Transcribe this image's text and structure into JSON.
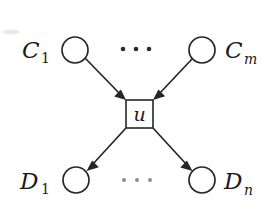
{
  "figure": {
    "background_color": "#ffffff",
    "ink_color": "#262626",
    "width": 278,
    "height": 212
  },
  "nodes": {
    "parents": [
      {
        "id": "C1",
        "label_base": "C",
        "label_sub": "1",
        "sub_style": "upright",
        "label_text": "C₁",
        "shape": "circle",
        "cx": 75,
        "cy": 50,
        "r": 13,
        "label_x": 22,
        "label_y": 58,
        "sub_x": 41,
        "sub_y": 63
      },
      {
        "id": "Cm",
        "label_base": "C",
        "label_sub": "m",
        "sub_style": "italic",
        "label_text": "Cₘ",
        "shape": "circle",
        "cx": 202,
        "cy": 50,
        "r": 13,
        "label_x": 225,
        "label_y": 58,
        "sub_x": 244,
        "sub_y": 64
      }
    ],
    "unit": {
      "id": "u",
      "label_text": "u",
      "shape": "square",
      "x": 126,
      "y": 100,
      "width": 27,
      "height": 28,
      "cx": 139.5,
      "cy": 114,
      "label_x": 139.5,
      "label_y": 121
    },
    "children": [
      {
        "id": "D1",
        "label_base": "D",
        "label_sub": "1",
        "sub_style": "upright",
        "label_text": "D₁",
        "shape": "circle",
        "cx": 76,
        "cy": 180,
        "r": 13,
        "label_x": 20,
        "label_y": 189,
        "sub_x": 41,
        "sub_y": 194
      },
      {
        "id": "Dn",
        "label_base": "D",
        "label_sub": "n",
        "sub_style": "italic",
        "label_text": "Dₙ",
        "shape": "circle",
        "cx": 202,
        "cy": 180,
        "r": 13,
        "label_x": 224,
        "label_y": 189,
        "sub_x": 244,
        "sub_y": 195
      }
    ]
  },
  "edges": [
    {
      "id": "C1-to-u",
      "from": "C1",
      "to": "u",
      "direction": "down-right",
      "arrowhead": "solid-triangle"
    },
    {
      "id": "Cm-to-u",
      "from": "Cm",
      "to": "u",
      "direction": "down-left",
      "arrowhead": "solid-triangle"
    },
    {
      "id": "u-to-D1",
      "from": "u",
      "to": "D1",
      "direction": "down-left",
      "arrowhead": "solid-triangle"
    },
    {
      "id": "u-to-Dn",
      "from": "u",
      "to": "Dn",
      "direction": "down-right",
      "arrowhead": "solid-triangle"
    }
  ],
  "ellipses": [
    {
      "id": "top-ellipsis",
      "text": "···",
      "between": [
        "C1",
        "Cm"
      ],
      "y": 49,
      "dots_x": [
        123,
        136,
        149
      ],
      "radius": 2.3,
      "shade": "dark"
    },
    {
      "id": "bottom-ellipsis",
      "text": "···",
      "between": [
        "D1",
        "Dn"
      ],
      "y": 180,
      "dots_x": [
        124,
        137,
        150
      ],
      "radius": 2.0,
      "shade": "light"
    }
  ]
}
